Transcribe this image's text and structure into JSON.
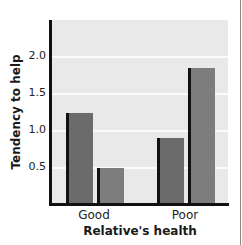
{
  "chart_data": {
    "type": "bar",
    "title": "",
    "xlabel": "Relative's health",
    "ylabel": "Tendency to help",
    "categories": [
      "Good",
      "Poor"
    ],
    "series": [
      {
        "name": "Series 1 (left bar)",
        "values": [
          1.25,
          0.9
        ]
      },
      {
        "name": "Series 2 (right bar)",
        "values": [
          0.5,
          1.85
        ]
      }
    ],
    "yticks": [
      "0.5",
      "1.0",
      "1.5",
      "2.0"
    ],
    "ylim": [
      0,
      2.5
    ],
    "grid": true,
    "legend": null
  },
  "axis": {
    "y_title": "Tendency to help",
    "x_title": "Relative's health",
    "y_ticks": [
      "2.0",
      "1.5",
      "1.0",
      "0.5"
    ],
    "categories": [
      "Good",
      "Poor"
    ]
  },
  "colors": {
    "plot_background": "#e9e9e9",
    "gridline": "#fbfbfb",
    "series_1": "#6b6b6b",
    "series_2": "#7d7d7d",
    "axis": "#111111"
  }
}
